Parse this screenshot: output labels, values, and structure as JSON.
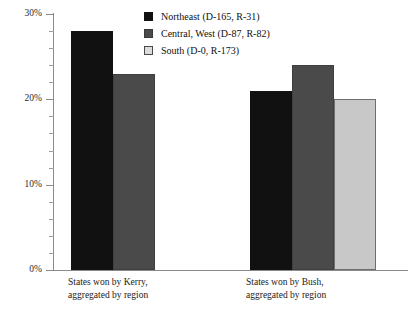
{
  "chart_data": {
    "type": "bar",
    "title": "",
    "subtitle": "",
    "xlabel": "",
    "ylabel": "",
    "ylim": [
      0,
      30
    ],
    "y_unit": "%",
    "grid": false,
    "legend_position": "top-center",
    "categories": [
      "States won by Kerry,\naggregated by region",
      "States won by Bush,\naggregated by region"
    ],
    "series": [
      {
        "name": "Northeast (D-165, R-31)",
        "color": "#111111",
        "values": [
          28,
          21
        ]
      },
      {
        "name": "Central, West (D-87, R-82)",
        "color": "#4a4a4a",
        "values": [
          23,
          24
        ]
      },
      {
        "name": "South (D-0, R-173)",
        "color": "#c8c8c8",
        "values": [
          null,
          20
        ]
      }
    ],
    "y_ticks_major": [
      {
        "value": 0,
        "label": "0%"
      },
      {
        "value": 10,
        "label": "10%"
      },
      {
        "value": 20,
        "label": "20%"
      },
      {
        "value": 30,
        "label": "30%"
      }
    ],
    "y_ticks_minor": [
      2,
      4,
      6,
      8,
      12,
      14,
      16,
      18,
      22,
      24,
      26,
      28
    ]
  },
  "legend": {
    "items": [
      {
        "label": "Northeast (D-165, R-31)",
        "swatch": "c-northeast"
      },
      {
        "label": "Central, West (D-87, R-82)",
        "swatch": "c-central"
      },
      {
        "label": "South (D-0, R-173)",
        "swatch": "c-south"
      }
    ]
  },
  "axis": {
    "y_labels": [
      "30%",
      "20%",
      "10%",
      "0%"
    ]
  },
  "groups": [
    {
      "label": "States won by Kerry,\naggregated by region"
    },
    {
      "label": "States won by Bush,\naggregated by region"
    }
  ]
}
